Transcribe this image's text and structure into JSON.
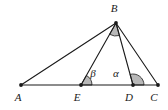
{
  "figure": {
    "kind": "plane-geometry-diagram",
    "canvas": {
      "width": 168,
      "height": 110
    },
    "colors": {
      "background": "#ffffff",
      "stroke": "#1a1a1a",
      "angle_fill": "#b8b8b8",
      "angle_stroke": "#1a1a1a",
      "label": "#1a1a1a"
    },
    "points": [
      {
        "id": "A",
        "label": "A",
        "x": 21,
        "y": 85,
        "label_x": 18,
        "label_y": 101,
        "dot": true
      },
      {
        "id": "E",
        "label": "E",
        "x": 81,
        "y": 85,
        "label_x": 77,
        "label_y": 101,
        "dot": true
      },
      {
        "id": "D",
        "label": "D",
        "x": 133,
        "y": 85,
        "label_x": 129,
        "label_y": 101,
        "dot": true
      },
      {
        "id": "C",
        "label": "C",
        "x": 158,
        "y": 85,
        "label_x": 154,
        "label_y": 101,
        "dot": true
      },
      {
        "id": "B",
        "label": "B",
        "x": 116,
        "y": 23,
        "label_x": 114,
        "label_y": 12,
        "dot": true
      }
    ],
    "segments": [
      {
        "id": "AC",
        "from": "A",
        "to": "C",
        "note": "base line through E and D"
      },
      {
        "id": "AB",
        "from": "A",
        "to": "B"
      },
      {
        "id": "EB",
        "from": "E",
        "to": "B"
      },
      {
        "id": "DB",
        "from": "D",
        "to": "B"
      },
      {
        "id": "CB",
        "from": "C",
        "to": "B"
      }
    ],
    "angles": [
      {
        "id": "angle-B",
        "vertex": "B",
        "label": "",
        "filled": true,
        "radius": 13,
        "start_deg": 248,
        "end_deg": 285,
        "note": "angle EBD at apex, unlabelled gray sector"
      },
      {
        "id": "angle-beta",
        "vertex": "E",
        "label": "β",
        "filled": true,
        "radius": 11,
        "start_deg": 0,
        "end_deg": 50,
        "label_x": 93,
        "label_y": 77,
        "note": "angle BEC at E, labelled beta"
      },
      {
        "id": "angle-alpha",
        "vertex": "D",
        "label": "α",
        "filled": true,
        "radius": 11,
        "start_deg": 0,
        "end_deg": 68,
        "label_x": 116,
        "label_y": 77,
        "note": "angle BDC at D, labelled alpha"
      }
    ]
  }
}
